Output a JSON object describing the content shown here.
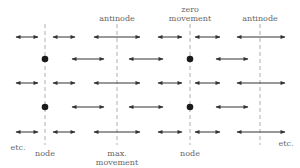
{
  "labels": {
    "top_antinode_1": "antinode",
    "top_zero_line1": "zero",
    "top_zero_line2": "movement",
    "top_antinode_2": "antinode",
    "bottom_etc_left": "etc.",
    "bottom_node_1": "node",
    "bottom_max_line1": "max.",
    "bottom_max_line2": "movement",
    "bottom_node_2": "node",
    "bottom_etc_right": "etc."
  },
  "colors": {
    "arrow": "#333333",
    "dashed_line": "#999999",
    "dot": "#1a1a1a",
    "text": "#666666"
  },
  "geometry": {
    "dashed_lines_x": [
      45,
      117,
      190,
      260
    ],
    "nodes_x": [
      45,
      190
    ],
    "antinodes_x": [
      117,
      260
    ],
    "rows": [
      {
        "y": 37,
        "type": "arrows_long",
        "arrows": [
          [
            16,
            38
          ],
          [
            53,
            75
          ],
          [
            94,
            140
          ],
          [
            158,
            182
          ],
          [
            195,
            220
          ],
          [
            237,
            285
          ]
        ]
      },
      {
        "y": 59,
        "type": "dots_and_arrows",
        "dots": [
          45,
          190
        ],
        "arrows": [
          [
            72,
            104
          ],
          [
            129,
            163
          ],
          [
            216,
            248
          ]
        ],
        "left_arrow_tail": [
          140,
          150
        ]
      },
      {
        "y": 83,
        "type": "arrows_long",
        "arrows": [
          [
            16,
            38
          ],
          [
            53,
            75
          ],
          [
            94,
            140
          ],
          [
            158,
            182
          ],
          [
            195,
            220
          ],
          [
            237,
            285
          ]
        ]
      },
      {
        "y": 107,
        "type": "dots_and_arrows",
        "dots": [
          45,
          190
        ],
        "arrows": [
          [
            72,
            104
          ],
          [
            129,
            163
          ],
          [
            216,
            248
          ]
        ]
      },
      {
        "y": 132,
        "type": "arrows_long",
        "arrows": [
          [
            16,
            38
          ],
          [
            53,
            75
          ],
          [
            94,
            140
          ],
          [
            158,
            182
          ],
          [
            195,
            220
          ],
          [
            237,
            285
          ]
        ]
      }
    ]
  }
}
